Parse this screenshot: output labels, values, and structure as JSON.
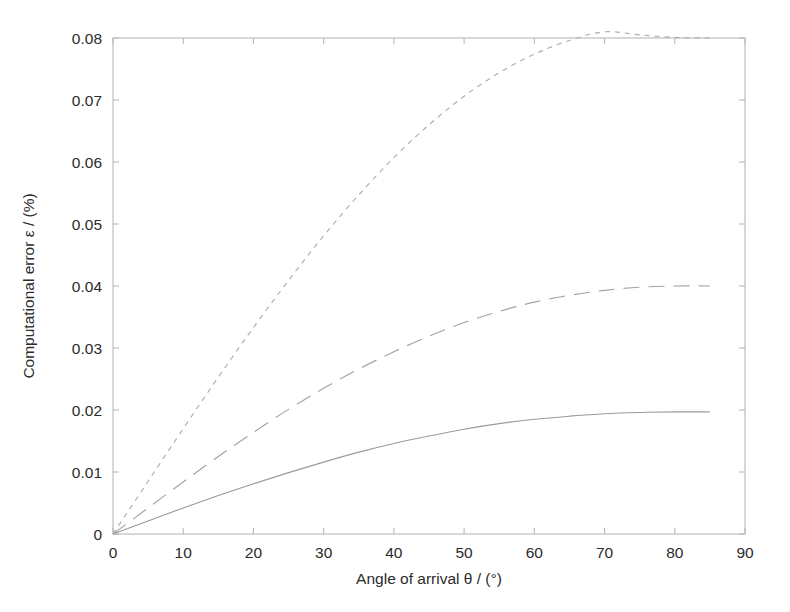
{
  "chart_data": {
    "type": "line",
    "title": "",
    "xlabel": "Angle of arrival   θ / (°)",
    "ylabel": "Computational error   ε / (%)",
    "xlim": [
      0,
      90
    ],
    "ylim": [
      0,
      0.08
    ],
    "grid": false,
    "legend": "none",
    "xticks": [
      0,
      10,
      20,
      30,
      40,
      50,
      60,
      70,
      80,
      90
    ],
    "xticklabels": [
      "0",
      "10",
      "20",
      "30",
      "40",
      "50",
      "60",
      "70",
      "80",
      "90"
    ],
    "yticks": [
      0,
      0.01,
      0.02,
      0.03,
      0.04,
      0.05,
      0.06,
      0.07,
      0.08
    ],
    "yticklabels": [
      "0",
      "0.01",
      "0.02",
      "0.03",
      "0.04",
      "0.05",
      "0.06",
      "0.07",
      "0.08"
    ],
    "x": [
      0,
      5,
      10,
      15,
      20,
      25,
      30,
      35,
      40,
      45,
      50,
      55,
      60,
      65,
      70,
      75,
      80,
      85
    ],
    "series": [
      {
        "name": "series-solid",
        "style": "solid",
        "color": "#9a9a9a",
        "values": [
          0,
          0.0021,
          0.0042,
          0.0062,
          0.0081,
          0.0099,
          0.0116,
          0.0132,
          0.0146,
          0.0158,
          0.0169,
          0.0178,
          0.0185,
          0.019,
          0.0194,
          0.0196,
          0.0197,
          0.0197
        ]
      },
      {
        "name": "series-dashed",
        "style": "dashed",
        "color": "#a3a3a3",
        "values": [
          0,
          0.0042,
          0.0084,
          0.0125,
          0.0164,
          0.0201,
          0.0235,
          0.0266,
          0.0294,
          0.0319,
          0.0341,
          0.0359,
          0.0374,
          0.0385,
          0.0393,
          0.0398,
          0.04,
          0.04
        ]
      },
      {
        "name": "series-dotted",
        "style": "dotted",
        "color": "#adadad",
        "values": [
          0,
          0.0085,
          0.017,
          0.0253,
          0.0333,
          0.0409,
          0.0481,
          0.0547,
          0.0607,
          0.066,
          0.0706,
          0.0744,
          0.0774,
          0.0796,
          0.081,
          0.0805,
          0.0801,
          0.08
        ]
      }
    ]
  },
  "axes": {
    "x_title": "Angle of arrival   θ / (°)",
    "y_title": "Computational error   ε / (%)"
  }
}
